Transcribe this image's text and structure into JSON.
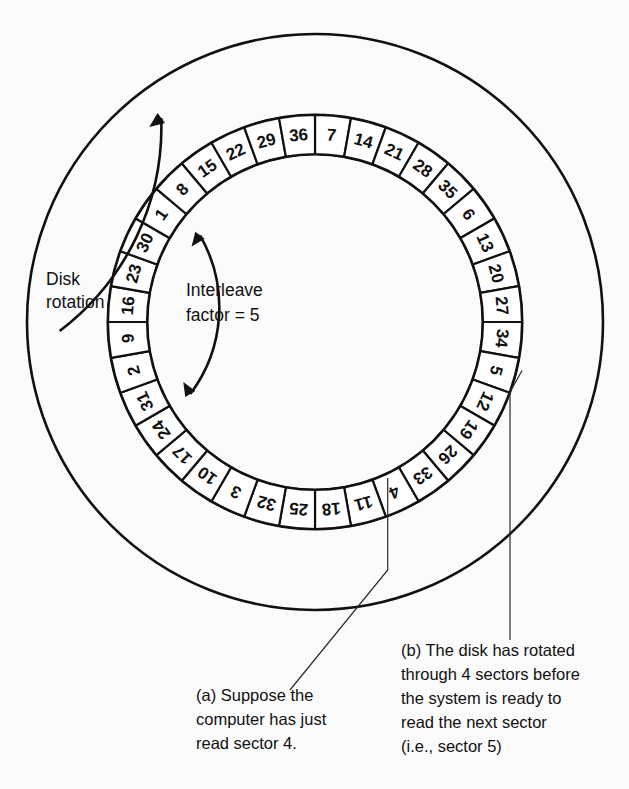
{
  "diagram": {
    "geometry": {
      "center_x": 315,
      "center_y": 322,
      "outer_circle_radius": 288,
      "sector_outer_radius": 207,
      "sector_inner_radius": 168,
      "sector_count": 36,
      "start_angle_deg": -90
    },
    "colors": {
      "background": "#fbfbfb",
      "ink": "#111111",
      "sector_fill": "#ffffff",
      "leader": "#2a2a2a"
    },
    "sectors": [
      {
        "index": 0,
        "label": "7"
      },
      {
        "index": 1,
        "label": "14"
      },
      {
        "index": 2,
        "label": "21"
      },
      {
        "index": 3,
        "label": "28"
      },
      {
        "index": 4,
        "label": "35"
      },
      {
        "index": 5,
        "label": "6"
      },
      {
        "index": 6,
        "label": "13"
      },
      {
        "index": 7,
        "label": "20"
      },
      {
        "index": 8,
        "label": "27"
      },
      {
        "index": 9,
        "label": "34"
      },
      {
        "index": 10,
        "label": "5"
      },
      {
        "index": 11,
        "label": "12"
      },
      {
        "index": 12,
        "label": "19"
      },
      {
        "index": 13,
        "label": "26"
      },
      {
        "index": 14,
        "label": "33"
      },
      {
        "index": 15,
        "label": "4"
      },
      {
        "index": 16,
        "label": "11"
      },
      {
        "index": 17,
        "label": "18"
      },
      {
        "index": 18,
        "label": "25"
      },
      {
        "index": 19,
        "label": "32"
      },
      {
        "index": 20,
        "label": "3"
      },
      {
        "index": 21,
        "label": "10"
      },
      {
        "index": 22,
        "label": "17"
      },
      {
        "index": 23,
        "label": "24"
      },
      {
        "index": 24,
        "label": "31"
      },
      {
        "index": 25,
        "label": "2"
      },
      {
        "index": 26,
        "label": "9"
      },
      {
        "index": 27,
        "label": "16"
      },
      {
        "index": 28,
        "label": "23"
      },
      {
        "index": 29,
        "label": "30"
      },
      {
        "index": 30,
        "label": "1"
      },
      {
        "index": 31,
        "label": "8"
      },
      {
        "index": 32,
        "label": "15"
      },
      {
        "index": 33,
        "label": "22"
      },
      {
        "index": 34,
        "label": "29"
      },
      {
        "index": 35,
        "label": "36"
      }
    ],
    "annotations": {
      "disk_rotation": {
        "line1": "Disk",
        "line2": "rotation",
        "x": 46,
        "y_line1": 285,
        "y_line2": 308
      },
      "interleave": {
        "line1": "Interleave",
        "line2": "factor = 5",
        "x": 186,
        "y_line1": 296,
        "y_line2": 321
      }
    },
    "captions": {
      "a": {
        "lines": [
          "(a) Suppose the",
          "computer has just",
          "read sector 4."
        ],
        "x": 196,
        "y_start": 701,
        "line_height": 24,
        "target_sector": "4"
      },
      "b": {
        "lines": [
          "(b) The disk has rotated",
          "through 4 sectors before",
          "the system is ready to",
          "read the next sector",
          "(i.e., sector 5)"
        ],
        "x": 401,
        "y_start": 656,
        "line_height": 24,
        "target_sector": "5"
      }
    }
  }
}
